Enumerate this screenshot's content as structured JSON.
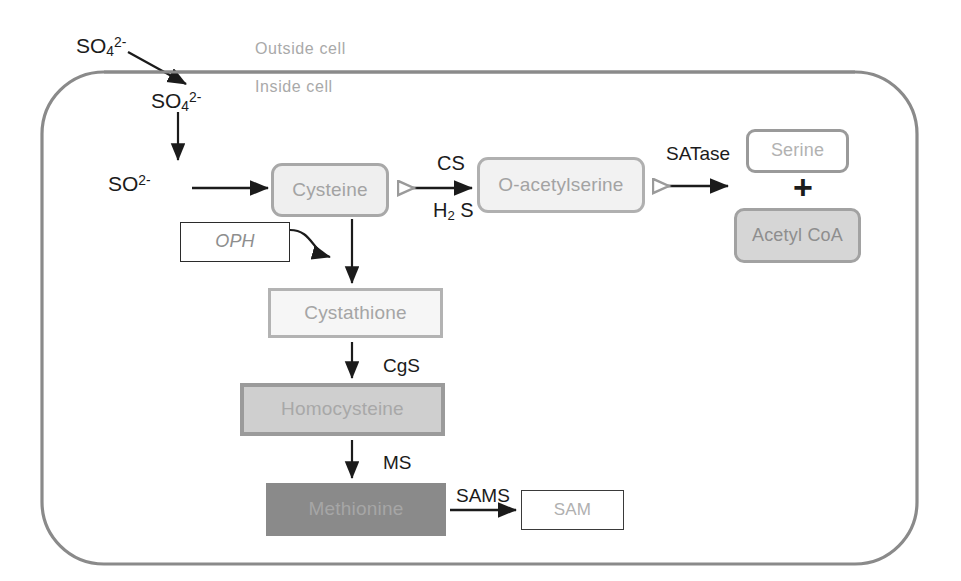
{
  "diagram": {
    "compartment_labels": {
      "outside": "Outside cell",
      "inside": "Inside cell"
    },
    "colors": {
      "membrane": "#8a8a8a",
      "cysteine_fill": "#efefef",
      "oas_fill": "#f2f2f2",
      "serine_fill": "#ffffff",
      "acetylcoa_fill": "#d6d6d6",
      "cystathione_fill": "#f6f6f6",
      "homocysteine_fill": "#cfcfcf",
      "methionine_fill": "#8a8a8a",
      "sam_fill": "#ffffff",
      "oph_fill": "#ffffff",
      "arrow": "#1b1b1b",
      "node_text": "#a3a3a3",
      "compartment_text": "#a9a9a9"
    }
  },
  "metabolites": {
    "sulfate_outside": {
      "formula": "SO",
      "sub": "4",
      "sup": "2-"
    },
    "sulfate_inside": {
      "formula": "SO",
      "sub": "4",
      "sup": "2-"
    },
    "sulfite": {
      "formula": "SO",
      "sup": "2-"
    },
    "cysteine": "Cysteine",
    "o_acetylserine": "O-acetylserine",
    "serine": "Serine",
    "acetyl_coa": "Acetyl CoA",
    "cystathione": "Cystathione",
    "homocysteine": "Homocysteine",
    "methionine": "Methionine",
    "sam": "SAM"
  },
  "enzymes": {
    "cs": "CS",
    "satase": "SATase",
    "cgs": "CgS",
    "ms": "MS",
    "sams": "SAMS",
    "oph": "OPH"
  },
  "cofactors": {
    "h2s_pre": "H",
    "h2s_sub": "2",
    "h2s_post": " S"
  },
  "operators": {
    "plus": "+"
  }
}
